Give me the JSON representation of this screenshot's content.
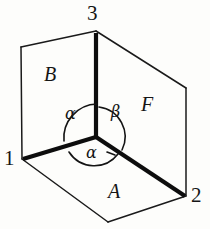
{
  "figure": {
    "kind": "geometry-diagram",
    "background_color": "#fdfdfb",
    "stroke_color": "#111111",
    "vertices": {
      "v3": {
        "label": "3",
        "x": 96,
        "y": 31
      },
      "v1": {
        "label": "1",
        "x": 22,
        "y": 159
      },
      "v2": {
        "label": "2",
        "x": 186,
        "y": 196
      },
      "corner": {
        "label": "",
        "x": 96,
        "y": 137
      },
      "back_top_left": {
        "label": "",
        "x": 21,
        "y": 47
      },
      "back_top_right": {
        "label": "",
        "x": 186,
        "y": 88
      },
      "front_bottom": {
        "label": "",
        "x": 108,
        "y": 222
      }
    },
    "faces": [
      {
        "id": "B",
        "label": "B",
        "position": "left-vertical",
        "label_x": 51,
        "label_y": 77
      },
      {
        "id": "F",
        "label": "F",
        "position": "right-vertical",
        "label_x": 148,
        "label_y": 107
      },
      {
        "id": "A",
        "label": "A",
        "position": "bottom-horizontal",
        "label_x": 115,
        "label_y": 194
      }
    ],
    "angles": [
      {
        "id": "alpha-left",
        "label": "α",
        "at": "corner",
        "between": [
          "corner-to-v3",
          "corner-to-v1"
        ],
        "label_x": 72,
        "label_y": 116
      },
      {
        "id": "beta-right",
        "label": "β",
        "at": "corner",
        "between": [
          "corner-to-v3",
          "corner-to-v2"
        ],
        "label_x": 117,
        "label_y": 114
      },
      {
        "id": "alpha-bottom",
        "label": "α",
        "at": "corner",
        "between": [
          "corner-to-v1",
          "corner-to-v2"
        ],
        "label_x": 92,
        "label_y": 155
      }
    ],
    "emphasized_edges": [
      "corner-to-v3",
      "corner-to-v1",
      "corner-to-v2"
    ]
  }
}
